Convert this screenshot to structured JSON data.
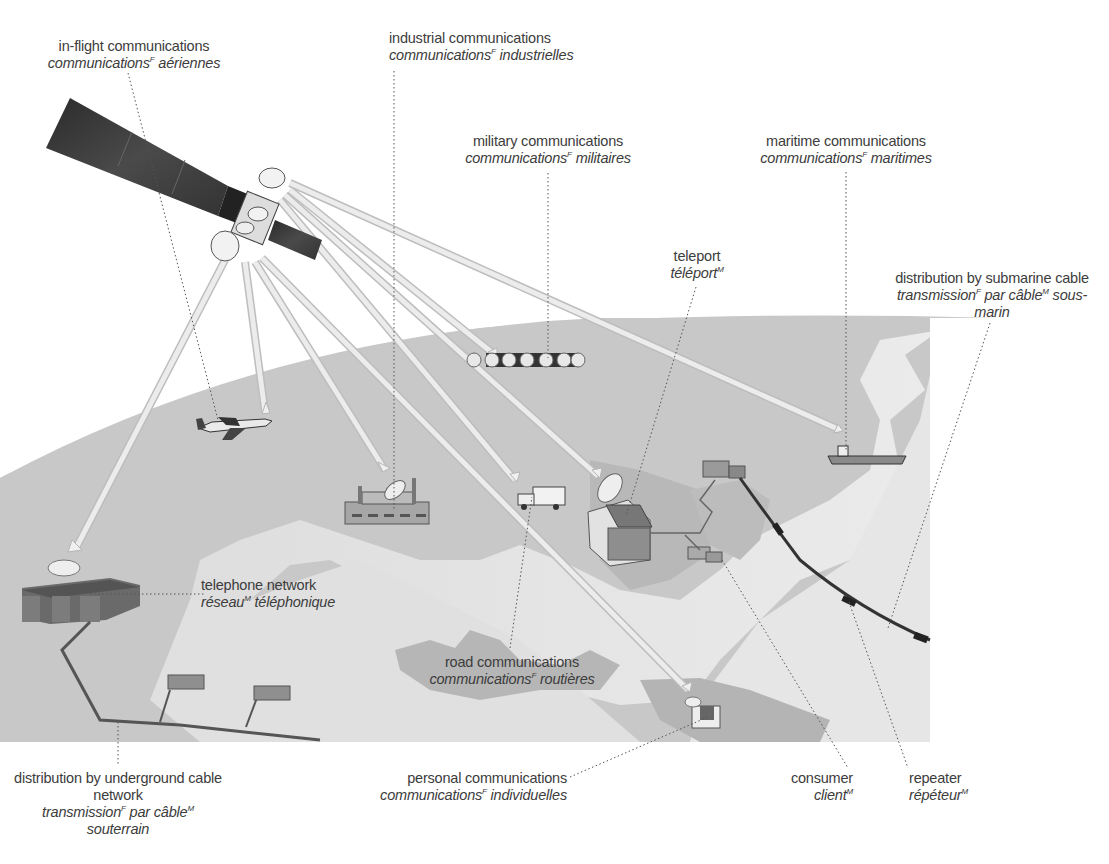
{
  "diagram": {
    "title_hidden": "satellite communications",
    "colors": {
      "background": "#ffffff",
      "land": "#c9c9c9",
      "sea_light": "#e2e2e2",
      "dark_land": "#b0b0b0",
      "beam": "#e9e9e9",
      "beam_edge": "#bdbdbd",
      "satellite_panel": "#3a3a3a",
      "text": "#3c3c3c",
      "leader": "#555555"
    },
    "labels": [
      {
        "id": "in-flight",
        "en": "in-flight communications",
        "fr": "communications",
        "sup": "F",
        "fr2": "aériennes"
      },
      {
        "id": "industrial",
        "en": "industrial communications",
        "fr": "communications",
        "sup": "F",
        "fr2": "industrielles"
      },
      {
        "id": "military",
        "en": "military communications",
        "fr": "communications",
        "sup": "F",
        "fr2": "militaires"
      },
      {
        "id": "maritime",
        "en": "maritime communications",
        "fr": "communications",
        "sup": "F",
        "fr2": "maritimes"
      },
      {
        "id": "teleport",
        "en": "teleport",
        "fr": "téléport",
        "sup": "M",
        "fr2": ""
      },
      {
        "id": "submarine",
        "en": "distribution by submarine cable",
        "fr": "transmission",
        "sup": "F",
        "fr2": "par câble",
        "sup2": "M",
        "fr3": "sous-",
        "fr4": "marin"
      },
      {
        "id": "telephone",
        "en": "telephone network",
        "fr": "réseau",
        "sup": "M",
        "fr2": "téléphonique"
      },
      {
        "id": "road",
        "en": "road communications",
        "fr": "communications",
        "sup": "F",
        "fr2": "routières"
      },
      {
        "id": "underground",
        "en": "distribution by underground cable",
        "en2": "network",
        "fr": "transmission",
        "sup": "F",
        "fr2": "par câble",
        "sup2": "M",
        "fr3": "souterrain"
      },
      {
        "id": "personal",
        "en": "personal communications",
        "fr": "communications",
        "sup": "F",
        "fr2": "individuelles"
      },
      {
        "id": "consumer",
        "en": "consumer",
        "fr": "client",
        "sup": "M",
        "fr2": ""
      },
      {
        "id": "repeater",
        "en": "repeater",
        "fr": "répéteur",
        "sup": "M",
        "fr2": ""
      }
    ]
  }
}
